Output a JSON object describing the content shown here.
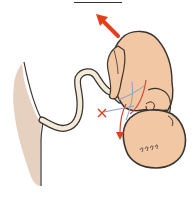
{
  "figure": {
    "title": "",
    "colors": {
      "skin": "#f2c7a3",
      "outline": "#3a3330",
      "placenta": "#e6d0c0",
      "cord_fill": "#f3ead7",
      "arrow": "#e0401b",
      "vein": "#8aa0c8",
      "artery": "#d0483a"
    },
    "annotations": {
      "direction_arrow": "up-left",
      "cross_mark": "×",
      "down_arrow": "down"
    },
    "parts": [
      "placenta",
      "umbilical-cord",
      "fetus-body",
      "fetus-head",
      "fetus-hand",
      "blood-vessels"
    ]
  }
}
